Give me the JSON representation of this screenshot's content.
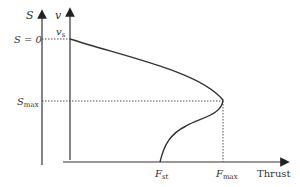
{
  "diagram": {
    "axes": {
      "s_axis_label": "S",
      "v_axis_label": "v",
      "x_axis_label": "Thrust"
    },
    "labels": {
      "s_zero": "S = 0",
      "v_s": "v",
      "v_s_sub": "s",
      "s_max": "S",
      "s_max_sub": "max",
      "f_st": "F",
      "f_st_sub": "st",
      "f_max": "F",
      "f_max_sub": "max"
    },
    "colors": {
      "line": "#333333",
      "dotted": "#555555"
    }
  }
}
